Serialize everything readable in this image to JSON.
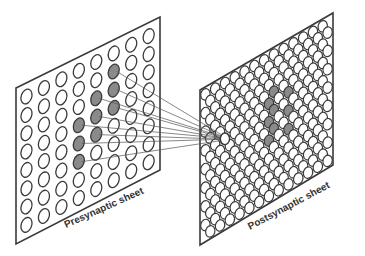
{
  "diagram": {
    "type": "neural-projection-schematic",
    "colors": {
      "background": "#ffffff",
      "outline": "#3a3a3a",
      "active_fill": "#8a8a8a",
      "inactive_fill": "#ffffff",
      "connection": "#555555"
    },
    "presynaptic": {
      "label": "Presynaptic sheet",
      "grid_rows": 8,
      "grid_cols": 8,
      "active_cells": [
        [
          1,
          5
        ],
        [
          2,
          4
        ],
        [
          2,
          5
        ],
        [
          3,
          3
        ],
        [
          3,
          4
        ],
        [
          3,
          5
        ],
        [
          4,
          3
        ],
        [
          4,
          4
        ],
        [
          5,
          3
        ]
      ]
    },
    "postsynaptic": {
      "label": "Postsynaptic sheet",
      "layout": "hexagonal-dense",
      "active_cluster_count": 9,
      "target_highlight": "single-neuron"
    },
    "connections": {
      "count": 9,
      "description": "Each active presynaptic neuron projects to one postsynaptic neuron"
    }
  }
}
